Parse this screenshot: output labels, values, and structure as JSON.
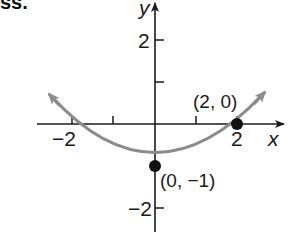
{
  "problem_label": "ss.",
  "axes": {
    "x_label": "x",
    "y_label": "y",
    "x_ticks": [
      {
        "value": -2,
        "label": "−2"
      },
      {
        "value": -1,
        "label": ""
      },
      {
        "value": 1,
        "label": ""
      },
      {
        "value": 2,
        "label": "2"
      }
    ],
    "y_ticks": [
      {
        "value": 2,
        "label": "2"
      },
      {
        "value": 1,
        "label": ""
      },
      {
        "value": -2,
        "label": "−2"
      }
    ]
  },
  "curve": {
    "type": "parabola",
    "equation": "y = x^2/4 - 1",
    "color": "#8c8c8c",
    "arrows_both_ends": true
  },
  "points": [
    {
      "x": 2,
      "y": 0,
      "label": "(2, 0)"
    },
    {
      "x": 0,
      "y": -1,
      "label": "(0, −1)"
    }
  ],
  "colors": {
    "axis": "#1a1a1a",
    "curve": "#8c8c8c",
    "point": "#111111"
  }
}
